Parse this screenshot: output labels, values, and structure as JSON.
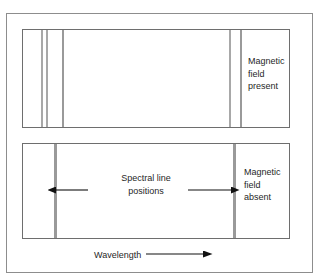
{
  "figure": {
    "background_color": "#ffffff",
    "line_color": "#a8a8a8",
    "border_color": "#6e6e6e",
    "text_color": "#1f1f1f"
  },
  "panels": [
    {
      "id": "panel-top",
      "caption": "Magnetic\nfield\npresent",
      "caption_lines": [
        "Magnetic",
        "field",
        "present"
      ],
      "spectral_lines_x": [
        41,
        46,
        62,
        229,
        240
      ],
      "line_count": 5
    },
    {
      "id": "panel-bottom",
      "caption": "Magnetic\nfield\nabsent",
      "caption_lines": [
        "Magnetic",
        "field",
        "absent"
      ],
      "spectral_lines_x": [
        54,
        233
      ],
      "line_count": 2
    }
  ],
  "annotations": {
    "spectral_positions_label": "Spectral line\npositions",
    "spectral_positions_lines": [
      "Spectral line",
      "positions"
    ],
    "wavelength_label": "Wavelength",
    "wavelength_arrow": "right-arrow",
    "measure_arrow": "double-headed-arrow"
  }
}
